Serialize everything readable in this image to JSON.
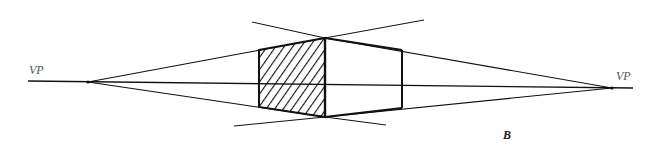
{
  "figure": {
    "labels": {
      "left_vanishing_point": "VP",
      "right_vanishing_point": "VP",
      "panel": "B"
    },
    "colors": {
      "stroke": "#111111",
      "background": "#ffffff",
      "label": "#555555"
    },
    "elements": {
      "horizon_line": "horizon line",
      "hatched_face": "shaded left face",
      "front_edge": "front vertical edge",
      "right_edge": "rear vertical edge"
    }
  }
}
